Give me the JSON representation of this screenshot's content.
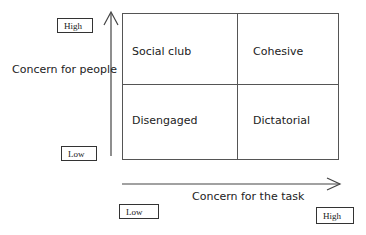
{
  "diagram": {
    "type": "quadrant_matrix",
    "y_axis": {
      "label": "Concern for people",
      "high_label": "High",
      "low_label": "Low"
    },
    "x_axis": {
      "label": "Concern for the task",
      "low_label": "Low",
      "high_label": "High"
    },
    "quadrants": {
      "top_left": "Social club",
      "top_right": "Cohesive",
      "bottom_left": "Disengaged",
      "bottom_right": "Dictatorial"
    }
  }
}
